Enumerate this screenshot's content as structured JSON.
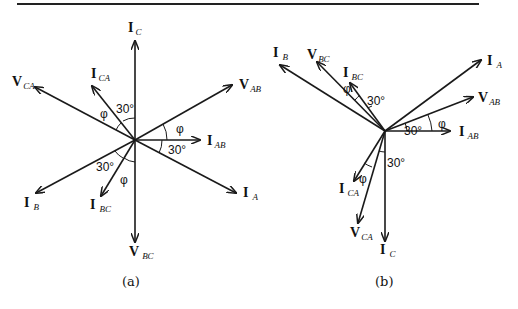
{
  "figure": {
    "diagrams": [
      {
        "caption": "(a)",
        "vectors": [
          {
            "main": "I",
            "sub": "C"
          },
          {
            "main": "V",
            "sub": "CA"
          },
          {
            "main": "I",
            "sub": "CA"
          },
          {
            "main": "V",
            "sub": "AB"
          },
          {
            "main": "I",
            "sub": "AB"
          },
          {
            "main": "I",
            "sub": "A"
          },
          {
            "main": "I",
            "sub": "B"
          },
          {
            "main": "I",
            "sub": "BC"
          },
          {
            "main": "V",
            "sub": "BC"
          }
        ],
        "angles": [
          "30°",
          "φ",
          "φ",
          "30°",
          "30°",
          "φ"
        ]
      },
      {
        "caption": "(b)",
        "vectors": [
          {
            "main": "I",
            "sub": "B"
          },
          {
            "main": "V",
            "sub": "BC"
          },
          {
            "main": "I",
            "sub": "BC"
          },
          {
            "main": "I",
            "sub": "A"
          },
          {
            "main": "V",
            "sub": "AB"
          },
          {
            "main": "I",
            "sub": "AB"
          },
          {
            "main": "I",
            "sub": "CA"
          },
          {
            "main": "V",
            "sub": "CA"
          },
          {
            "main": "I",
            "sub": "C"
          }
        ],
        "angles": [
          "φ",
          "30°",
          "30°",
          "φ",
          "30°",
          "φ"
        ]
      }
    ]
  }
}
